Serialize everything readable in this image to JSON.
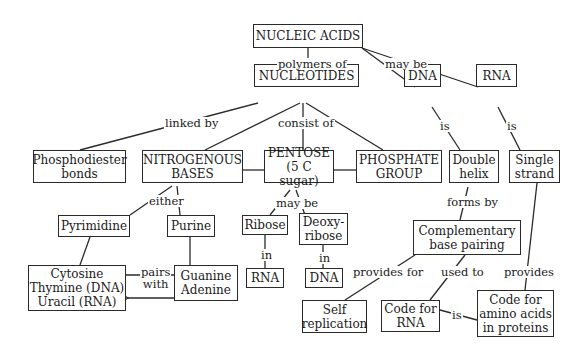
{
  "nodes": {
    "nucleic_acids": "NUCLEIC ACIDS",
    "nucleotides": "NUCLEOTIDES",
    "dna_top": "DNA",
    "rna_top": "RNA",
    "phosphodiester": "Phosphodiester\nbonds",
    "nitrogenous_bases": "NITROGENOUS\nBASES",
    "pentose": "PENTOSE\n(5 C sugar)",
    "phosphate_group": "PHOSPHATE\nGROUP",
    "double_helix": "Double\nhelix",
    "single_strand": "Single\nstrand",
    "pyrimidine": "Pyrimidine",
    "purine": "Purine",
    "ribose": "Ribose",
    "deoxyribose": "Deoxy-\nribose",
    "complementary": "Complementary\nbase pairing",
    "pyrimidines_list": "Cytosine\nThymine (DNA)\nUracil (RNA)",
    "purines_list": "Guanine\nAdenine",
    "rna_bottom": "RNA",
    "dna_bottom": "DNA",
    "self_replication": "Self\nreplication",
    "code_for_rna": "Code for\nRNA",
    "code_amino": "Code for\namino acids\nin proteins"
  },
  "links": {
    "polymers_of": "polymers of",
    "may_be_top": "may be",
    "linked_by": "linked by",
    "consist_of": "consist of",
    "is_dna": "is",
    "is_rna": "is",
    "either": "either",
    "may_be_pentose": "may be",
    "forms_by": "forms by",
    "in_ribose": "in",
    "in_deoxy": "in",
    "pairs_with": "pairs\nwith",
    "provides_for": "provides for",
    "used_to": "used to",
    "provides": "provides",
    "is_code": "is"
  }
}
